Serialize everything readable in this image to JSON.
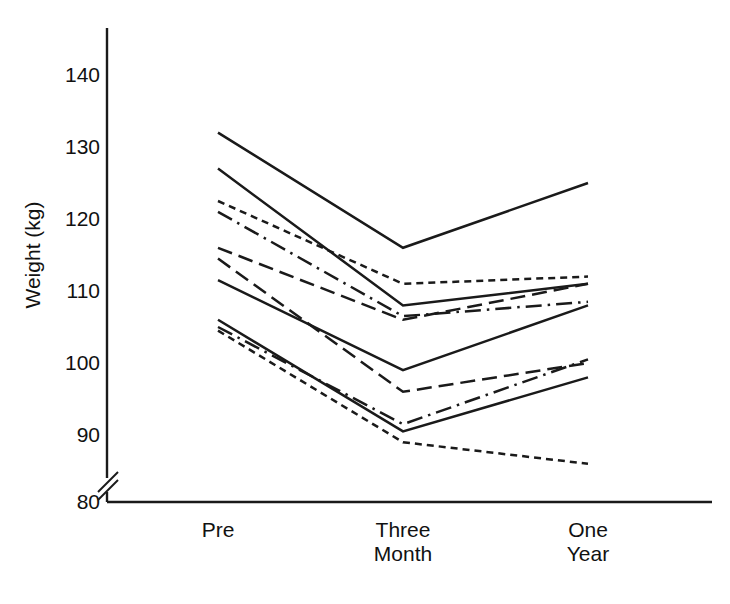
{
  "figure": {
    "background": "#ffffff",
    "ink_color": "#1a1a1a",
    "axis_label_y": "Weight (kg)",
    "axis_break_note": "y-axis break between 80 and 90"
  },
  "axes": {
    "y_ticks": [
      "140",
      "130",
      "120",
      "110",
      "100",
      "90",
      "80"
    ],
    "x_ticks": [
      "Pre",
      "Three\nMonth",
      "One\nYear"
    ]
  },
  "chart_data": {
    "type": "line",
    "title": "",
    "xlabel": "",
    "ylabel": "Weight (kg)",
    "categories": [
      "Pre",
      "Three Month",
      "One Year"
    ],
    "ylim": [
      80,
      145
    ],
    "yticks": [
      80,
      90,
      100,
      110,
      120,
      130,
      140
    ],
    "y_axis_break": [
      80,
      90
    ],
    "grid": false,
    "legend": "none",
    "markers": "none",
    "series": [
      {
        "name": "Subject 1",
        "style": "solid",
        "values": [
          132.0,
          116.0,
          125.0
        ]
      },
      {
        "name": "Subject 2",
        "style": "solid",
        "values": [
          127.0,
          108.0,
          111.0
        ]
      },
      {
        "name": "Subject 3",
        "style": "dotted",
        "values": [
          122.5,
          111.0,
          112.0
        ]
      },
      {
        "name": "Subject 4",
        "style": "dashdot",
        "values": [
          121.0,
          106.5,
          108.5
        ]
      },
      {
        "name": "Subject 5",
        "style": "dashed",
        "values": [
          116.0,
          106.0,
          111.0
        ]
      },
      {
        "name": "Subject 6",
        "style": "dashed",
        "values": [
          114.5,
          96.0,
          100.0
        ]
      },
      {
        "name": "Subject 7",
        "style": "solid",
        "values": [
          111.5,
          99.0,
          108.0
        ]
      },
      {
        "name": "Subject 8",
        "style": "solid",
        "values": [
          106.0,
          90.5,
          98.0
        ]
      },
      {
        "name": "Subject 9",
        "style": "dashdot",
        "values": [
          105.0,
          91.5,
          100.5
        ]
      },
      {
        "name": "Subject 10",
        "style": "dotted",
        "values": [
          104.5,
          89.0,
          86.0
        ]
      }
    ]
  }
}
